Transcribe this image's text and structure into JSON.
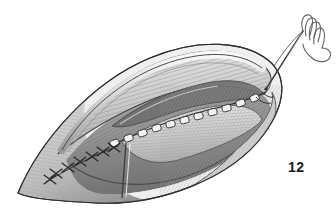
{
  "figure": {
    "number": "12",
    "caption_text": "12",
    "background_color": "#ffffff",
    "ink_color": "#2b2b2b",
    "midtone_color": "#9a9a9a",
    "light_tone_color": "#d6d6d6",
    "shadow_color": "#5a5a5a",
    "medium": "grayscale pen-and-ink medical illustration"
  },
  "labels": {
    "wound_outline": "elliptical-incision-outline",
    "skin_edge_upper": "upper-skin-edge",
    "skin_edge_lower": "lower-skin-edge",
    "muscle_fibers_upper": "upper-muscle-fiber-hatching",
    "muscle_fibers_lower": "lower-muscle-fiber-hatching",
    "fascia_flap": "retracted-fascia-flap",
    "deep_suture_line": "running-suture-line",
    "interrupted_sutures": "interrupted-x-sutures",
    "needle": "straight-surgical-needle",
    "suture_thread": "suture-thread-loop"
  },
  "suture_line": {
    "type": "running-continuous",
    "stitch_count": 11,
    "path_description": "diagonal from lower-left toward upper-right along wound midline"
  },
  "interrupted_sutures": {
    "type": "interrupted-x",
    "stitch_count": 7,
    "path_description": "lower-left segment of closure line"
  },
  "needle": {
    "entry_point_x": 268,
    "entry_point_y": 88,
    "tip_x": 300,
    "tip_y": 30,
    "thread_loops": 4
  }
}
